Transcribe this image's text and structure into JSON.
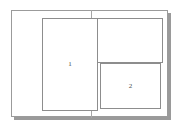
{
  "diagram": {
    "background_color": "#ffffff",
    "frame": {
      "name": "outer-window-frame",
      "border_color": "#9b9b9b",
      "fill_color": "#ffffff",
      "shadow_color": "#9a9a9a"
    },
    "divider": {
      "name": "vertical-split-divider",
      "color": "#a6a6a6",
      "orientation": "vertical"
    },
    "panes": [
      {
        "id": "pane-1",
        "label": "1",
        "border_color": "#8d8d8d",
        "fill_color": "#ffffff",
        "position": "left-tall"
      },
      {
        "id": "pane-top-right",
        "label": "",
        "border_color": "#8d8d8d",
        "fill_color": "#ffffff",
        "position": "top-right"
      },
      {
        "id": "pane-2",
        "label": "2",
        "border_color": "#8d8d8d",
        "fill_color": "#ffffff",
        "position": "bottom-right"
      }
    ]
  }
}
